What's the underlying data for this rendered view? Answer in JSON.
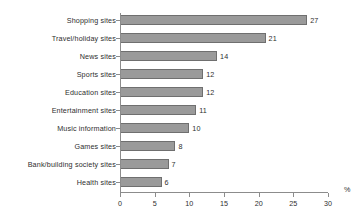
{
  "chart_data": {
    "type": "bar",
    "orientation": "horizontal",
    "title": "",
    "xlabel": "%",
    "ylabel": "",
    "xlim": [
      0,
      30
    ],
    "xticks": [
      0,
      5,
      10,
      15,
      20,
      25,
      30
    ],
    "grid": false,
    "legend": null,
    "categories": [
      "Shopping sites",
      "Travel/holiday sites",
      "News sites",
      "Sports sites",
      "Education sites",
      "Entertainment sites",
      "Music information",
      "Games sites",
      "Bank/building society sites",
      "Health sites"
    ],
    "values": [
      27,
      21,
      14,
      12,
      12,
      11,
      10,
      8,
      7,
      6
    ],
    "value_labels": [
      "27",
      "21",
      "14",
      "12",
      "12",
      "11",
      "10",
      "8",
      "7",
      "6"
    ],
    "tick_labels": [
      "0",
      "5",
      "10",
      "15",
      "20",
      "25",
      "30"
    ],
    "colors": {
      "bar_fill": "#9a9a9a",
      "bar_stroke": "#6f6f6f",
      "axis": "#8c8c8c",
      "text": "#2e2e2e",
      "background": "#ffffff"
    }
  }
}
